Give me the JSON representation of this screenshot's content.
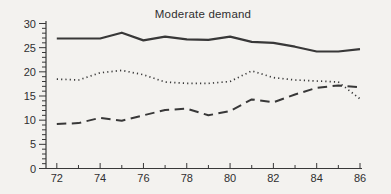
{
  "chart_data": {
    "type": "line",
    "title": "Moderate demand",
    "xlabel": "",
    "ylabel": "",
    "x": [
      72,
      73,
      74,
      75,
      76,
      77,
      78,
      79,
      80,
      81,
      82,
      83,
      84,
      85,
      86
    ],
    "xlim": [
      71.5,
      86
    ],
    "ylim": [
      0,
      30
    ],
    "x_label_years": [
      72,
      74,
      76,
      78,
      80,
      82,
      84,
      86
    ],
    "x_minor_step": 1,
    "y_major_ticks": [
      0,
      5,
      10,
      15,
      20,
      25,
      30
    ],
    "y_tick_labels": [
      "0",
      "5",
      "10",
      "15",
      "20",
      "25",
      "30"
    ],
    "y_minor_step": 1,
    "grid": false,
    "legend": "none",
    "series": [
      {
        "name": "solid-line",
        "style": "solid",
        "values": [
          26.9,
          26.9,
          26.9,
          28.1,
          26.5,
          27.3,
          26.7,
          26.6,
          27.3,
          26.2,
          26.0,
          25.2,
          24.2,
          24.2,
          24.7
        ]
      },
      {
        "name": "dotted-line",
        "style": "dotted",
        "values": [
          18.5,
          18.3,
          19.8,
          20.3,
          19.4,
          17.9,
          17.6,
          17.6,
          18.0,
          20.2,
          18.8,
          18.3,
          18.1,
          17.9,
          14.4
        ]
      },
      {
        "name": "dashed-line",
        "style": "dashed",
        "values": [
          9.2,
          9.4,
          10.5,
          9.9,
          11.0,
          12.1,
          12.4,
          11.0,
          11.9,
          14.3,
          13.7,
          15.3,
          16.7,
          17.2,
          16.8
        ]
      }
    ],
    "colors": {
      "line": "#383838",
      "text": "#2f2f2f",
      "background": "#f3f2ef"
    }
  }
}
